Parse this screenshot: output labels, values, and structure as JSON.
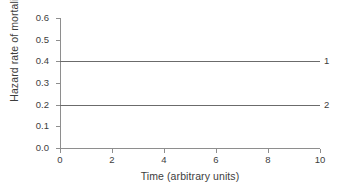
{
  "chart_data": {
    "type": "line",
    "title": "",
    "xlabel": "Time (arbitrary units)",
    "ylabel": "Hazard rate of mortality",
    "xlim": [
      0,
      10
    ],
    "ylim": [
      0.0,
      0.6
    ],
    "xticks": [
      "0",
      "2",
      "4",
      "6",
      "8",
      "10"
    ],
    "xtick_values": [
      0,
      2,
      4,
      6,
      8,
      10
    ],
    "yticks": [
      "0.0",
      "0.1",
      "0.2",
      "0.3",
      "0.4",
      "0.5",
      "0.6"
    ],
    "ytick_values": [
      0.0,
      0.1,
      0.2,
      0.3,
      0.4,
      0.5,
      0.6
    ],
    "grid": false,
    "legend_position": "right-inline-labels",
    "x": [
      0,
      10
    ],
    "series": [
      {
        "name": "1",
        "label": "1",
        "values": [
          0.4,
          0.4
        ],
        "constant": 0.4,
        "color": "#6b6b6b"
      },
      {
        "name": "2",
        "label": "2",
        "values": [
          0.2,
          0.2
        ],
        "constant": 0.2,
        "color": "#6b6b6b"
      }
    ],
    "axis_color": "#8e8e8e",
    "text_color": "#3d3d3d",
    "background": "#ffffff"
  }
}
